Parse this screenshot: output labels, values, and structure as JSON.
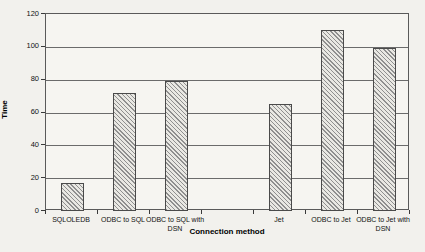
{
  "chart_data": {
    "type": "bar",
    "title": "",
    "xlabel": "Connection method",
    "ylabel": "Time",
    "ylim": [
      0,
      120
    ],
    "yticks": [
      0,
      20,
      40,
      60,
      80,
      100,
      120
    ],
    "grid": true,
    "legend": false,
    "bar_style": "diagonal-hatch",
    "categories": [
      "SQLOLEDB",
      "ODBC to SQL",
      "ODBC to SQL with DSN",
      "Jet",
      "ODBC to Jet",
      "ODBC to Jet with DSN"
    ],
    "values": [
      17,
      72,
      79,
      65,
      110,
      99
    ]
  },
  "layout_slots": [
    {
      "label": "SQLOLEDB",
      "value": 17
    },
    {
      "label": "ODBC to SQL",
      "value": 72
    },
    {
      "label": "ODBC to SQL with\nDSN",
      "value": 79
    },
    {
      "label": "",
      "value": null
    },
    {
      "label": "Jet",
      "value": 65
    },
    {
      "label": "ODBC to Jet",
      "value": 110
    },
    {
      "label": "ODBC to Jet with\nDSN",
      "value": 99
    }
  ],
  "colors": {
    "background": "#f2f1ed",
    "plot_background": "#f6f5f1",
    "gridline": "#6b6b6b",
    "axis": "#5a5a5a",
    "bar_fill": "#e9e8e3",
    "bar_hatch": "#8f8f8f",
    "bar_border": "#4a4a4a",
    "text": "#111111"
  }
}
